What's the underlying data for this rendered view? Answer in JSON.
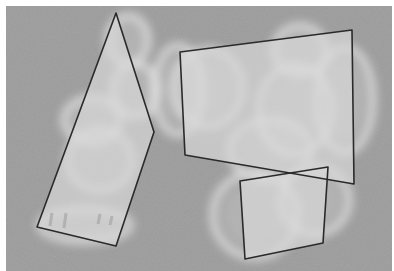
{
  "image": {
    "subject": "Glass chess pieces on gray surface with highlighted polygon regions",
    "width": 394,
    "height": 271,
    "photo_area": {
      "x": 6,
      "y": 6,
      "w": 386,
      "h": 265
    },
    "colors": {
      "border": "#ffffff",
      "background": "#9a9a9a",
      "piece_highlight": "#f2f2f2",
      "polygon_fill": "#d8d8d8",
      "polygon_stroke": "#2a2a2a"
    }
  },
  "pieces": [
    {
      "cx": 128,
      "cy": 40,
      "rx": 20,
      "ry": 24
    },
    {
      "cx": 135,
      "cy": 90,
      "rx": 22,
      "ry": 26
    },
    {
      "cx": 92,
      "cy": 120,
      "rx": 28,
      "ry": 22
    },
    {
      "cx": 100,
      "cy": 160,
      "rx": 32,
      "ry": 30
    },
    {
      "cx": 208,
      "cy": 88,
      "rx": 34,
      "ry": 38
    },
    {
      "cx": 178,
      "cy": 90,
      "rx": 24,
      "ry": 44
    },
    {
      "cx": 300,
      "cy": 50,
      "rx": 26,
      "ry": 24
    },
    {
      "cx": 295,
      "cy": 110,
      "rx": 36,
      "ry": 44
    },
    {
      "cx": 345,
      "cy": 100,
      "rx": 28,
      "ry": 52
    },
    {
      "cx": 270,
      "cy": 150,
      "rx": 40,
      "ry": 30
    },
    {
      "cx": 255,
      "cy": 215,
      "rx": 42,
      "ry": 42
    },
    {
      "cx": 315,
      "cy": 200,
      "rx": 34,
      "ry": 34
    },
    {
      "cx": 85,
      "cy": 225,
      "rx": 45,
      "ry": 16
    }
  ],
  "polygons": [
    {
      "name": "left-region",
      "points": "116,13 154,132 116,246 37,227"
    },
    {
      "name": "right-region",
      "points": "180,52 352,30 354,184 185,155"
    },
    {
      "name": "bottom-region",
      "points": "240,181 328,167 323,243 245,259"
    }
  ]
}
